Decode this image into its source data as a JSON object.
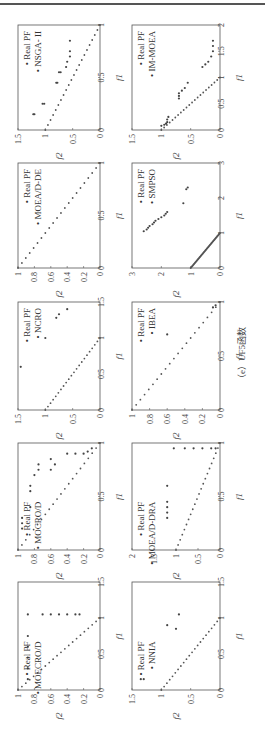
{
  "figure": {
    "caption": "（e）UF5函数",
    "rotation": "figure rotated 90° counter-clockwise"
  },
  "chart_data": [
    {
      "type": "scatter",
      "title": "NSGA-II",
      "xlabel": "f1",
      "ylabel": "f2",
      "xlim": [
        0,
        1
      ],
      "ylim": [
        0,
        1.5
      ],
      "xticks": [
        "0",
        "0.5",
        "1"
      ],
      "yticks": [
        "0",
        "0.5",
        "1",
        "1.5"
      ],
      "legend": [
        "Real PF",
        "NSGA- II"
      ],
      "series": [
        {
          "name": "Real PF",
          "points": "line f2=1-f1, 21 points"
        },
        {
          "name": "NSGA- II",
          "points": [
            [
              0.15,
              1.2
            ],
            [
              0.15,
              1.22
            ],
            [
              0.25,
              1.05
            ],
            [
              0.25,
              1.02
            ],
            [
              0.45,
              0.8
            ],
            [
              0.45,
              0.78
            ],
            [
              0.55,
              0.75
            ],
            [
              0.55,
              0.72
            ],
            [
              0.6,
              0.62
            ],
            [
              0.65,
              0.6
            ],
            [
              0.7,
              0.55
            ],
            [
              0.75,
              0.55
            ],
            [
              0.85,
              0.55
            ]
          ]
        }
      ]
    },
    {
      "type": "scatter",
      "title": "IM-MOEA",
      "xlabel": "f1",
      "ylabel": "f2",
      "xlim": [
        0,
        2
      ],
      "ylim": [
        0,
        1.5
      ],
      "xticks": [
        "0",
        "0.5",
        "1",
        "1.5",
        "2"
      ],
      "yticks": [
        "0",
        "0.5",
        "1",
        "1.5"
      ],
      "legend": [
        "Real PF",
        "IM-MOEA"
      ],
      "series": [
        {
          "name": "Real PF",
          "points": "line f2=1-f1, 21 points"
        },
        {
          "name": "IM-MOEA",
          "points": [
            [
              0.08,
              1.0
            ],
            [
              0.1,
              0.95
            ],
            [
              0.12,
              0.92
            ],
            [
              0.15,
              0.9
            ],
            [
              0.2,
              0.9
            ],
            [
              0.25,
              0.88
            ],
            [
              0.6,
              0.7
            ],
            [
              0.65,
              0.7
            ],
            [
              0.7,
              0.7
            ],
            [
              0.75,
              0.65
            ],
            [
              0.8,
              0.6
            ],
            [
              0.9,
              0.55
            ],
            [
              1.2,
              0.3
            ],
            [
              1.25,
              0.25
            ],
            [
              1.3,
              0.2
            ],
            [
              1.4,
              0.15
            ],
            [
              1.5,
              0.12
            ],
            [
              1.6,
              0.12
            ],
            [
              1.7,
              0.12
            ]
          ]
        }
      ]
    },
    {
      "type": "scatter",
      "title": "MOEA/D-DE",
      "xlabel": "f1",
      "ylabel": "f2",
      "xlim": [
        0,
        1
      ],
      "ylim": [
        0,
        1
      ],
      "xticks": [
        "0",
        "0.5",
        "1"
      ],
      "yticks": [
        "0",
        "0.2",
        "0.4",
        "0.6",
        "0.8",
        "1"
      ],
      "legend": [
        "Real PF",
        "MOEA/D-DE"
      ],
      "series": [
        {
          "name": "Real PF",
          "points": "line f2=1-f1, 21 points"
        },
        {
          "name": "MOEA/D-DE",
          "points": "coincides with Real PF"
        }
      ]
    },
    {
      "type": "scatter",
      "title": "SMPSO",
      "xlabel": "f1",
      "ylabel": "f2",
      "xlim": [
        0,
        3
      ],
      "ylim": [
        0,
        3
      ],
      "xticks": [
        "0",
        "1",
        "2",
        "3"
      ],
      "yticks": [
        "0",
        "1",
        "2",
        "3"
      ],
      "legend": [
        "Real PF",
        "SMPSO"
      ],
      "series": [
        {
          "name": "Real PF",
          "points": "line f2=1-f1, dense"
        },
        {
          "name": "SMPSO",
          "points": [
            [
              1.05,
              2.6
            ],
            [
              1.1,
              2.5
            ],
            [
              1.15,
              2.45
            ],
            [
              1.2,
              2.4
            ],
            [
              1.25,
              2.3
            ],
            [
              1.3,
              2.25
            ],
            [
              1.35,
              2.2
            ],
            [
              1.4,
              2.1
            ],
            [
              1.45,
              2.0
            ],
            [
              1.5,
              1.9
            ],
            [
              1.55,
              1.85
            ],
            [
              1.6,
              1.8
            ],
            [
              1.85,
              1.25
            ],
            [
              2.25,
              1.15
            ],
            [
              2.3,
              1.1
            ]
          ]
        }
      ]
    },
    {
      "type": "scatter",
      "title": "NCRO",
      "xlabel": "f1",
      "ylabel": "f2",
      "xlim": [
        0,
        1.5
      ],
      "ylim": [
        0,
        1.5
      ],
      "xticks": [
        "0",
        "0.5",
        "1",
        "1.5"
      ],
      "yticks": [
        "0",
        "0.5",
        "1",
        "1.5"
      ],
      "legend": [
        "Real PF",
        "NCRO"
      ],
      "series": [
        {
          "name": "Real PF",
          "points": "line f2=1-f1, 21 points"
        },
        {
          "name": "NCRO",
          "points": [
            [
              0.6,
              1.45
            ],
            [
              1.0,
              1.0
            ],
            [
              1.28,
              0.8
            ],
            [
              1.33,
              0.75
            ],
            [
              1.4,
              0.6
            ]
          ]
        }
      ]
    },
    {
      "type": "scatter",
      "title": "IBEA",
      "xlabel": "f1",
      "ylabel": "f2",
      "xlim": [
        0,
        1
      ],
      "ylim": [
        0,
        1
      ],
      "xticks": [
        "0",
        "0.5",
        "1"
      ],
      "yticks": [
        "0",
        "0.2",
        "0.4",
        "0.6",
        "0.8",
        "1"
      ],
      "legend": [
        "Real PF",
        "IBEA"
      ],
      "series": [
        {
          "name": "Real PF",
          "points": "line f2=1-f1, 21 points"
        },
        {
          "name": "IBEA",
          "points": [
            [
              0.7,
              0.6
            ],
            [
              0.95,
              0.08
            ],
            [
              0.97,
              0.05
            ]
          ]
        }
      ]
    },
    {
      "type": "scatter",
      "title": "MOCRO/D",
      "xlabel": "f1",
      "ylabel": "f2",
      "xlim": [
        0,
        1
      ],
      "ylim": [
        0,
        1
      ],
      "xticks": [
        "0",
        "0.5",
        "1"
      ],
      "yticks": [
        "0",
        "0.2",
        "0.4",
        "0.6",
        "0.8",
        "1"
      ],
      "legend": [
        "Real PF",
        "MOCRO/D"
      ],
      "series": [
        {
          "name": "Real PF",
          "points": "line f2=1-f1, 21 points"
        },
        {
          "name": "MOCRO/D",
          "points": [
            [
              0.2,
              0.95
            ],
            [
              0.25,
              0.95
            ],
            [
              0.3,
              0.95
            ],
            [
              0.4,
              0.85
            ],
            [
              0.55,
              0.85
            ],
            [
              0.6,
              0.85
            ],
            [
              0.7,
              0.8
            ],
            [
              0.75,
              0.75
            ],
            [
              0.8,
              0.75
            ],
            [
              0.75,
              0.6
            ],
            [
              0.8,
              0.55
            ],
            [
              0.85,
              0.6
            ],
            [
              0.9,
              0.4
            ],
            [
              0.9,
              0.3
            ],
            [
              0.9,
              0.2
            ],
            [
              0.92,
              0.15
            ],
            [
              0.95,
              0.1
            ]
          ]
        }
      ]
    },
    {
      "type": "scatter",
      "title": "MOEA/D-DRA",
      "xlabel": "f1",
      "ylabel": "f2",
      "xlim": [
        0,
        1
      ],
      "ylim": [
        0,
        2
      ],
      "xticks": [
        "0",
        "0.5",
        "1"
      ],
      "yticks": [
        "0",
        "0.5",
        "1",
        "1.5",
        "2"
      ],
      "legend": [
        "Real PF",
        "MOEA/D-DRA"
      ],
      "series": [
        {
          "name": "Real PF",
          "points": "line f2=1-f1, 21 points"
        },
        {
          "name": "MOEA/D-DRA",
          "points": [
            [
              0.3,
              1.2
            ],
            [
              0.35,
              1.2
            ],
            [
              0.4,
              1.2
            ],
            [
              0.45,
              1.2
            ],
            [
              0.6,
              1.2
            ],
            [
              0.95,
              1.05
            ],
            [
              0.95,
              0.8
            ],
            [
              0.95,
              0.6
            ],
            [
              0.95,
              0.4
            ],
            [
              0.95,
              0.2
            ],
            [
              0.95,
              0.1
            ]
          ]
        }
      ]
    },
    {
      "type": "scatter",
      "title": "MOECRO/D",
      "xlabel": "f1",
      "ylabel": "f2",
      "xlim": [
        0,
        1.5
      ],
      "ylim": [
        0,
        1
      ],
      "xticks": [
        "0",
        "0.5",
        "1",
        "1.5"
      ],
      "yticks": [
        "0",
        "0.2",
        "0.4",
        "0.6",
        "0.8",
        "1"
      ],
      "legend": [
        "Real PF",
        "MOECRO/D"
      ],
      "series": [
        {
          "name": "Real PF",
          "points": "line f2=1-f1, 21 points"
        },
        {
          "name": "MOECRO/D",
          "points": [
            [
              0.15,
              0.88
            ],
            [
              0.3,
              0.88
            ],
            [
              0.45,
              0.88
            ],
            [
              0.6,
              0.88
            ],
            [
              0.75,
              0.88
            ],
            [
              1.05,
              0.88
            ],
            [
              1.05,
              0.7
            ],
            [
              1.05,
              0.6
            ],
            [
              1.05,
              0.5
            ],
            [
              1.05,
              0.4
            ],
            [
              1.05,
              0.3
            ],
            [
              1.05,
              0.25
            ]
          ]
        }
      ]
    },
    {
      "type": "scatter",
      "title": "NNIA",
      "xlabel": "f1",
      "ylabel": "f2",
      "xlim": [
        0,
        1.5
      ],
      "ylim": [
        0,
        1.5
      ],
      "xticks": [
        "0",
        "0.5",
        "1",
        "1.5"
      ],
      "yticks": [
        "0",
        "0.5",
        "1",
        "1.5"
      ],
      "legend": [
        "Real PF",
        "NNIA"
      ],
      "series": [
        {
          "name": "Real PF",
          "points": "line f2=1-f1, 21 points"
        },
        {
          "name": "NNIA",
          "points": [
            [
              0.15,
              1.35
            ],
            [
              0.15,
              1.3
            ],
            [
              0.9,
              0.9
            ],
            [
              0.85,
              0.75
            ],
            [
              1.05,
              0.7
            ]
          ]
        }
      ]
    }
  ],
  "axes": {
    "x_label": "f1",
    "y_label": "f2"
  },
  "legend_real": "Real PF",
  "algorithms": [
    "NSGA- II",
    "IM-MOEA",
    "MOEA/D-DE",
    "SMPSO",
    "NCRO",
    "IBEA",
    "MOCRO/D",
    "MOEA/D-DRA",
    "MOECRO/D",
    "NNIA"
  ]
}
